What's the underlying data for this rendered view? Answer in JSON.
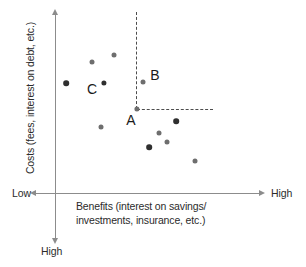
{
  "axes": {
    "y_title": "Costs (fees, interest on debt, etc.)",
    "x_title": "Benefits (interest on savings/ investments, insurance, etc.)",
    "x_low_label": "Low",
    "x_high_label": "High",
    "y_high_label": "High"
  },
  "colors": {
    "axis": "#8c8c8c",
    "point_gray": "#6e6e6e",
    "point_dark": "#2f2f2f",
    "guide": "#4d4d4d",
    "text": "#2b2b2b",
    "background": "#ffffff"
  },
  "chart_data": {
    "type": "scatter",
    "title": "",
    "xlabel": "Benefits (interest on savings/ investments, insurance, etc.)",
    "ylabel": "Costs (fees, interest on debt, etc.)",
    "xlim": [
      0,
      1
    ],
    "ylim": [
      0,
      1
    ],
    "xtick_labels": [
      "Low",
      "High"
    ],
    "ytick_labels": [
      "High"
    ],
    "grid": false,
    "legend": null,
    "note": "Y axis increases downward: origin at top, 'High' costs at bottom of the axis arrow",
    "points": [
      {
        "id": "p1",
        "px": 114,
        "py": 55,
        "x": 0.285,
        "y": 0.8,
        "color": "#6e6e6e",
        "size": 5,
        "label": ""
      },
      {
        "id": "p2",
        "px": 92,
        "py": 62,
        "x": 0.179,
        "y": 0.76,
        "color": "#6e6e6e",
        "size": 5,
        "label": ""
      },
      {
        "id": "p3",
        "px": 66,
        "py": 83,
        "x": 0.053,
        "y": 0.64,
        "color": "#2f2f2f",
        "size": 5.6,
        "label": ""
      },
      {
        "id": "C",
        "px": 104,
        "py": 83,
        "x": 0.237,
        "y": 0.64,
        "color": "#2f2f2f",
        "size": 5.2,
        "label": "C"
      },
      {
        "id": "B",
        "px": 143,
        "py": 82,
        "x": 0.425,
        "y": 0.645,
        "color": "#6e6e6e",
        "size": 5,
        "label": "B"
      },
      {
        "id": "A",
        "px": 137,
        "py": 109,
        "x": 0.397,
        "y": 0.49,
        "color": "#6e6e6e",
        "size": 5.2,
        "label": "A"
      },
      {
        "id": "p7",
        "px": 101,
        "py": 127,
        "x": 0.222,
        "y": 0.385,
        "color": "#6e6e6e",
        "size": 5,
        "label": ""
      },
      {
        "id": "p8",
        "px": 176,
        "py": 121,
        "x": 0.585,
        "y": 0.42,
        "color": "#2f2f2f",
        "size": 5.6,
        "label": ""
      },
      {
        "id": "p9",
        "px": 159,
        "py": 133,
        "x": 0.503,
        "y": 0.35,
        "color": "#6e6e6e",
        "size": 5,
        "label": ""
      },
      {
        "id": "p10",
        "px": 167,
        "py": 142,
        "x": 0.541,
        "y": 0.295,
        "color": "#6e6e6e",
        "size": 5,
        "label": ""
      },
      {
        "id": "p11",
        "px": 149,
        "py": 147,
        "x": 0.455,
        "y": 0.266,
        "color": "#2f2f2f",
        "size": 5.6,
        "label": ""
      },
      {
        "id": "p12",
        "px": 195,
        "py": 161,
        "x": 0.677,
        "y": 0.185,
        "color": "#6e6e6e",
        "size": 5,
        "label": ""
      }
    ],
    "annotations": [
      {
        "name": "guide-vertical",
        "from": [
          136,
          12
        ],
        "to": [
          136,
          109
        ],
        "style": "dashed"
      },
      {
        "name": "guide-horizontal",
        "from": [
          137,
          109
        ],
        "to": [
          213,
          109
        ],
        "style": "dashed"
      }
    ],
    "point_labels": [
      {
        "text": "A",
        "px": 131,
        "py": 120
      },
      {
        "text": "B",
        "px": 155,
        "py": 75
      },
      {
        "text": "C",
        "px": 92,
        "py": 89
      }
    ]
  }
}
